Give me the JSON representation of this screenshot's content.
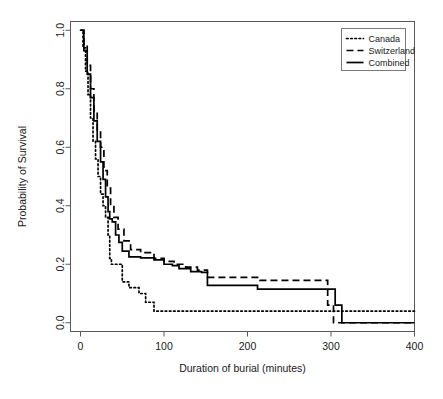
{
  "chart_data": {
    "type": "line",
    "subtype": "kaplan-meier-step",
    "title": "",
    "xlabel": "Duration of burial (minutes)",
    "ylabel": "Probability of Survival",
    "xlim": [
      -12,
      400
    ],
    "ylim": [
      -0.03,
      1.03
    ],
    "xticks": [
      0,
      100,
      200,
      300,
      400
    ],
    "xtick_labels": [
      "0",
      "100",
      "200",
      "300",
      "400"
    ],
    "yticks": [
      0.0,
      0.2,
      0.4,
      0.6,
      0.8,
      1.0
    ],
    "ytick_labels": [
      "0.0",
      "0.2",
      "0.4",
      "0.6",
      "0.8",
      "1.0"
    ],
    "grid": false,
    "legend_position": "top-right",
    "series": [
      {
        "name": "Canada",
        "style": "dotted",
        "color": "#000000",
        "points": [
          [
            0,
            1.0
          ],
          [
            3,
            0.94
          ],
          [
            6,
            0.86
          ],
          [
            9,
            0.78
          ],
          [
            12,
            0.7
          ],
          [
            15,
            0.62
          ],
          [
            18,
            0.56
          ],
          [
            21,
            0.5
          ],
          [
            24,
            0.44
          ],
          [
            27,
            0.4
          ],
          [
            30,
            0.36
          ],
          [
            33,
            0.3
          ],
          [
            35,
            0.22
          ],
          [
            37,
            0.2
          ],
          [
            48,
            0.2
          ],
          [
            50,
            0.14
          ],
          [
            58,
            0.12
          ],
          [
            70,
            0.1
          ],
          [
            78,
            0.07
          ],
          [
            88,
            0.04
          ],
          [
            100,
            0.04
          ],
          [
            400,
            0.04
          ]
        ]
      },
      {
        "name": "Switzerland",
        "style": "dashed",
        "color": "#000000",
        "points": [
          [
            0,
            1.0
          ],
          [
            4,
            0.95
          ],
          [
            8,
            0.88
          ],
          [
            12,
            0.8
          ],
          [
            16,
            0.72
          ],
          [
            20,
            0.66
          ],
          [
            24,
            0.6
          ],
          [
            28,
            0.52
          ],
          [
            32,
            0.46
          ],
          [
            36,
            0.4
          ],
          [
            40,
            0.36
          ],
          [
            45,
            0.32
          ],
          [
            52,
            0.28
          ],
          [
            60,
            0.25
          ],
          [
            72,
            0.24
          ],
          [
            88,
            0.22
          ],
          [
            100,
            0.21
          ],
          [
            112,
            0.2
          ],
          [
            126,
            0.19
          ],
          [
            140,
            0.18
          ],
          [
            152,
            0.155
          ],
          [
            175,
            0.155
          ],
          [
            215,
            0.145
          ],
          [
            260,
            0.145
          ],
          [
            290,
            0.145
          ],
          [
            296,
            0.06
          ],
          [
            303,
            0.0
          ],
          [
            400,
            0.0
          ]
        ]
      },
      {
        "name": "Combined",
        "style": "solid",
        "color": "#000000",
        "points": [
          [
            0,
            1.0
          ],
          [
            4,
            0.93
          ],
          [
            8,
            0.85
          ],
          [
            12,
            0.77
          ],
          [
            16,
            0.69
          ],
          [
            20,
            0.62
          ],
          [
            24,
            0.55
          ],
          [
            27,
            0.49
          ],
          [
            30,
            0.43
          ],
          [
            33,
            0.38
          ],
          [
            35,
            0.355
          ],
          [
            38,
            0.345
          ],
          [
            42,
            0.3
          ],
          [
            46,
            0.275
          ],
          [
            50,
            0.245
          ],
          [
            58,
            0.225
          ],
          [
            72,
            0.222
          ],
          [
            88,
            0.215
          ],
          [
            100,
            0.2
          ],
          [
            110,
            0.195
          ],
          [
            118,
            0.185
          ],
          [
            132,
            0.175
          ],
          [
            145,
            0.172
          ],
          [
            152,
            0.128
          ],
          [
            198,
            0.128
          ],
          [
            212,
            0.115
          ],
          [
            262,
            0.115
          ],
          [
            296,
            0.115
          ],
          [
            305,
            0.06
          ],
          [
            313,
            0.0
          ],
          [
            400,
            0.0
          ]
        ]
      }
    ],
    "legend_entries": [
      {
        "label": "Canada",
        "style": "dotted"
      },
      {
        "label": "Switzerland",
        "style": "dashed"
      },
      {
        "label": "Combined",
        "style": "solid"
      }
    ]
  }
}
